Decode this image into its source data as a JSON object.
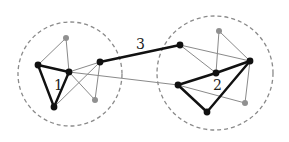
{
  "diagram": {
    "title": "",
    "colors": {
      "strong": "#111111",
      "weak": "#8a8a8a",
      "boundary": "#8a8a8a",
      "gray_node": "#909090"
    },
    "communities": [
      {
        "id": "c1",
        "label": "1",
        "cx": 70,
        "cy": 74,
        "rx": 52,
        "ry": 52,
        "label_x": 54,
        "label_y": 90
      },
      {
        "id": "c2",
        "label": "2",
        "cx": 215,
        "cy": 73,
        "rx": 58,
        "ry": 57,
        "label_x": 213,
        "label_y": 90
      }
    ],
    "bridge_label": {
      "text": "3",
      "x": 136,
      "y": 49
    },
    "nodes": [
      {
        "id": "a_top",
        "x": 66,
        "y": 38,
        "kind": "gray"
      },
      {
        "id": "a_left",
        "x": 38,
        "y": 65,
        "kind": "black"
      },
      {
        "id": "a_mid",
        "x": 69,
        "y": 72,
        "kind": "black"
      },
      {
        "id": "a_right",
        "x": 100,
        "y": 62,
        "kind": "black"
      },
      {
        "id": "a_gbot",
        "x": 95,
        "y": 100,
        "kind": "gray"
      },
      {
        "id": "a_bot",
        "x": 54,
        "y": 107,
        "kind": "black"
      },
      {
        "id": "b_tl",
        "x": 180,
        "y": 45,
        "kind": "black"
      },
      {
        "id": "b_top",
        "x": 219,
        "y": 31,
        "kind": "gray"
      },
      {
        "id": "b_right",
        "x": 250,
        "y": 61,
        "kind": "black"
      },
      {
        "id": "b_mid",
        "x": 216,
        "y": 73,
        "kind": "black"
      },
      {
        "id": "b_left",
        "x": 178,
        "y": 85,
        "kind": "black"
      },
      {
        "id": "b_gbr",
        "x": 245,
        "y": 103,
        "kind": "gray"
      },
      {
        "id": "b_bot",
        "x": 207,
        "y": 112,
        "kind": "black"
      }
    ],
    "edges": [
      {
        "from": "a_top",
        "to": "a_left",
        "weight": "weak"
      },
      {
        "from": "a_top",
        "to": "a_mid",
        "weight": "weak"
      },
      {
        "from": "a_mid",
        "to": "a_right",
        "weight": "weak"
      },
      {
        "from": "a_mid",
        "to": "a_gbot",
        "weight": "weak"
      },
      {
        "from": "a_bot",
        "to": "a_right",
        "weight": "weak"
      },
      {
        "from": "a_right",
        "to": "a_gbot",
        "weight": "weak"
      },
      {
        "from": "a_mid",
        "to": "b_left",
        "weight": "weak"
      },
      {
        "from": "b_tl",
        "to": "b_right",
        "weight": "weak"
      },
      {
        "from": "b_tl",
        "to": "b_mid",
        "weight": "weak"
      },
      {
        "from": "b_top",
        "to": "b_mid",
        "weight": "weak"
      },
      {
        "from": "b_top",
        "to": "b_right",
        "weight": "weak"
      },
      {
        "from": "b_left",
        "to": "b_gbr",
        "weight": "weak"
      },
      {
        "from": "b_right",
        "to": "b_gbr",
        "weight": "weak"
      },
      {
        "from": "a_left",
        "to": "a_mid",
        "weight": "strong"
      },
      {
        "from": "a_left",
        "to": "a_bot",
        "weight": "strong"
      },
      {
        "from": "a_mid",
        "to": "a_bot",
        "weight": "strong"
      },
      {
        "from": "a_right",
        "to": "b_tl",
        "weight": "strong"
      },
      {
        "from": "b_left",
        "to": "b_mid",
        "weight": "strong"
      },
      {
        "from": "b_mid",
        "to": "b_right",
        "weight": "strong"
      },
      {
        "from": "b_right",
        "to": "b_bot",
        "weight": "strong"
      },
      {
        "from": "b_left",
        "to": "b_bot",
        "weight": "strong"
      }
    ]
  }
}
